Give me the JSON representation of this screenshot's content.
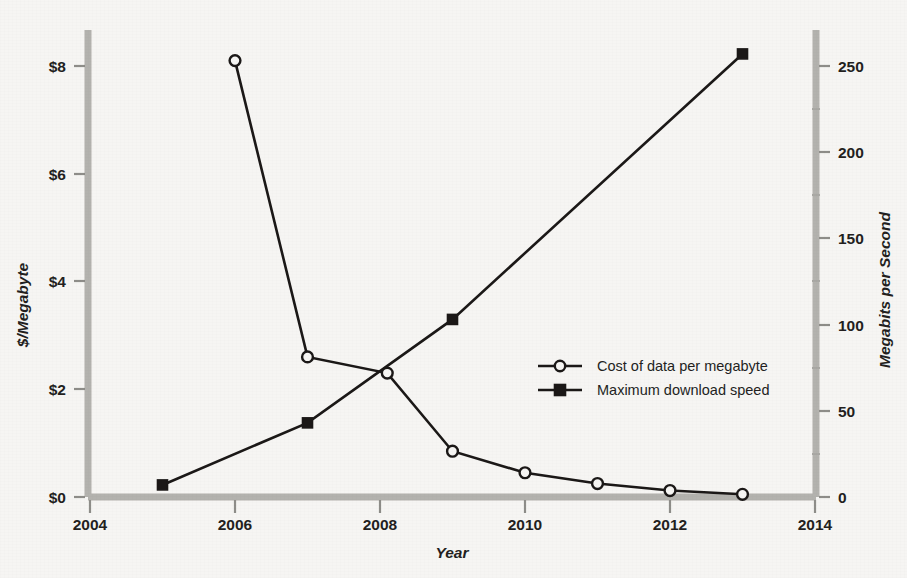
{
  "chart_data": {
    "type": "line",
    "title": "",
    "xlabel": "Year",
    "ylabel": "$/Megabyte",
    "y2label": "Megabits per Second",
    "xlim": [
      2003.6,
      2014.3
    ],
    "ylim": [
      0,
      8.8
    ],
    "y2lim": [
      0,
      277
    ],
    "grid": false,
    "legend_position": "center-right",
    "x_ticks": [
      2004,
      2006,
      2008,
      2010,
      2012,
      2014
    ],
    "x_tick_labels": [
      "2004",
      "2006",
      "2008",
      "2010",
      "2012",
      "2014"
    ],
    "y_ticks": [
      0,
      2,
      4,
      6,
      8
    ],
    "y_tick_labels": [
      "$0",
      "$2",
      "$4",
      "$6",
      "$8"
    ],
    "y2_ticks": [
      0,
      50,
      100,
      150,
      200,
      250
    ],
    "y2_tick_labels": [
      "0",
      "50",
      "100",
      "150",
      "200",
      "250"
    ],
    "y2_minor_ticks": [
      25,
      75,
      125,
      175,
      225
    ],
    "series": [
      {
        "name": "Cost of data per megabyte",
        "axis": "left",
        "marker": "open-circle",
        "x": [
          2006,
          2007,
          2008.1,
          2009,
          2010,
          2011,
          2012,
          2013
        ],
        "values": [
          8.1,
          2.6,
          2.3,
          0.85,
          0.45,
          0.25,
          0.12,
          0.05
        ]
      },
      {
        "name": "Maximum download speed",
        "axis": "right",
        "marker": "filled-square",
        "x": [
          2005,
          2007,
          2009,
          2013
        ],
        "values": [
          7,
          43,
          103,
          257
        ]
      }
    ],
    "legend": [
      {
        "label": "Cost of data per megabyte",
        "marker": "open-circle"
      },
      {
        "label": "Maximum download speed",
        "marker": "filled-square"
      }
    ],
    "colors": {
      "background": "#f6f5f3",
      "ink": "#1b1817",
      "spine": "#b3b2ae"
    }
  }
}
